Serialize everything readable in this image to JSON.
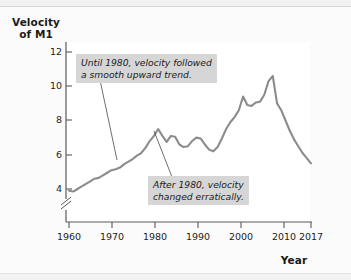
{
  "figure": {
    "y_axis_title": "Velocity\nof M1",
    "x_axis_title": "Year"
  },
  "annotations": [
    {
      "id": "note-until-1980",
      "text": "Until 1980, velocity followed\na smooth upward trend."
    },
    {
      "id": "note-after-1980",
      "text": "After 1980, velocity\nchanged erratically."
    }
  ],
  "colors": {
    "line": "#8c8c8c",
    "axis": "#5a5a5a",
    "note_bg": "#d6d6d6",
    "plot_bg": "#ffffff",
    "page_bg": "#f2f2f2"
  },
  "chart_data": {
    "type": "line",
    "title": "",
    "xlabel": "Year",
    "ylabel": "Velocity of M1",
    "xlim": [
      1960,
      2017
    ],
    "ylim": [
      3,
      12
    ],
    "y_axis_break": true,
    "grid": false,
    "legend": "none",
    "xticks": [
      1960,
      1970,
      1980,
      1990,
      2000,
      2010,
      2017
    ],
    "yticks": [
      4,
      6,
      8,
      10,
      12
    ],
    "series": [
      {
        "name": "Velocity of M1",
        "x": [
          1960,
          1961,
          1962,
          1963,
          1964,
          1965,
          1966,
          1967,
          1968,
          1969,
          1970,
          1971,
          1972,
          1973,
          1974,
          1975,
          1976,
          1977,
          1978,
          1979,
          1980,
          1981,
          1982,
          1983,
          1984,
          1985,
          1986,
          1987,
          1988,
          1989,
          1990,
          1991,
          1992,
          1993,
          1994,
          1995,
          1996,
          1997,
          1998,
          1999,
          2000,
          2001,
          2002,
          2003,
          2004,
          2005,
          2006,
          2007,
          2008,
          2009,
          2010,
          2011,
          2012,
          2013,
          2014,
          2015,
          2016,
          2017
        ],
        "values": [
          3.9,
          3.85,
          4.0,
          4.15,
          4.3,
          4.45,
          4.6,
          4.65,
          4.8,
          4.95,
          5.1,
          5.15,
          5.25,
          5.45,
          5.6,
          5.75,
          5.95,
          6.1,
          6.4,
          6.8,
          7.1,
          7.5,
          7.1,
          6.75,
          7.1,
          7.05,
          6.6,
          6.45,
          6.5,
          6.8,
          7.0,
          6.95,
          6.6,
          6.3,
          6.2,
          6.45,
          6.95,
          7.5,
          7.9,
          8.2,
          8.6,
          9.4,
          8.9,
          8.85,
          9.05,
          9.1,
          9.5,
          10.3,
          10.6,
          9.0,
          8.6,
          8.0,
          7.4,
          6.9,
          6.5,
          6.1,
          5.8,
          5.5
        ]
      }
    ]
  }
}
